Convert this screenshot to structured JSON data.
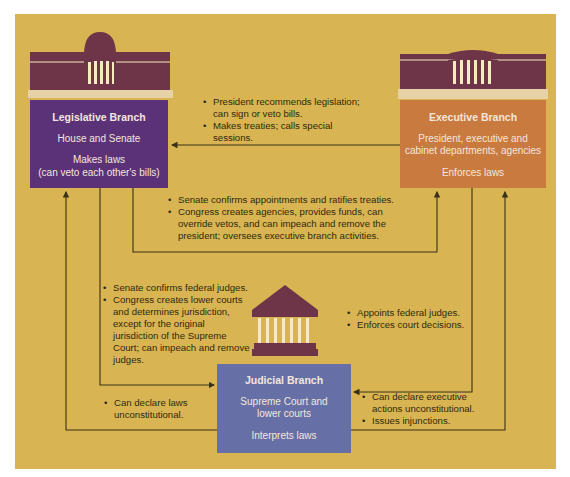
{
  "colors": {
    "background": "#d8b452",
    "legislative": "#5b3278",
    "executive": "#c97a3e",
    "judicial": "#6670a6",
    "building": "#6e3448",
    "column": "#f5ecc0",
    "line": "#3a3216"
  },
  "branches": {
    "legislative": {
      "title": "Legislative Branch",
      "members": "House and Senate",
      "role_line1": "Makes laws",
      "role_line2": "(can veto each other's bills)",
      "icon": "capitol-building-icon"
    },
    "executive": {
      "title": "Executive Branch",
      "members_line1": "President, executive and",
      "members_line2": "cabinet departments, agencies",
      "role": "Enforces laws",
      "icon": "white-house-icon"
    },
    "judicial": {
      "title": "Judicial Branch",
      "members_line1": "Supreme Court and",
      "members_line2": "lower courts",
      "role": "Interprets laws",
      "icon": "courthouse-icon"
    }
  },
  "checks": {
    "executive_on_legislative": [
      "President recommends legislation; can sign or veto bills.",
      "Makes treaties; calls special sessions."
    ],
    "legislative_on_executive": [
      "Senate confirms appointments and ratifies treaties.",
      "Congress creates agencies, provides funds, can override vetos, and can impeach and remove the president; oversees executive branch activities."
    ],
    "legislative_on_judicial": [
      "Senate confirms federal judges.",
      "Congress creates lower courts and determines jurisdiction, except for the original jurisdiction of the Supreme Court; can impeach and remove judges."
    ],
    "executive_on_judicial": [
      "Appoints federal judges.",
      "Enforces court decisions."
    ],
    "judicial_on_legislative": [
      "Can declare laws unconstitutional."
    ],
    "judicial_on_executive": [
      "Can declare executive actions unconstitutional.",
      "Issues injunctions."
    ]
  }
}
